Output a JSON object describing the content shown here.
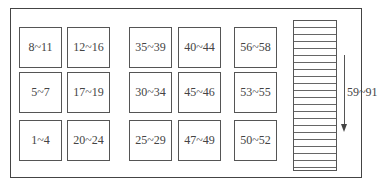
{
  "diagram": {
    "type": "storage-layout",
    "groups": [
      {
        "column": 1,
        "cells": [
          "8~11",
          "5~7",
          "1~4"
        ]
      },
      {
        "column": 2,
        "cells": [
          "12~16",
          "17~19",
          "20~24"
        ]
      },
      {
        "column": 3,
        "cells": [
          "35~39",
          "30~34",
          "25~29"
        ]
      },
      {
        "column": 4,
        "cells": [
          "40~44",
          "45~46",
          "47~49"
        ]
      },
      {
        "column": 5,
        "cells": [
          "56~58",
          "53~55",
          "50~52"
        ]
      }
    ],
    "stack": {
      "label": "59~91",
      "direction": "down",
      "stripe_count": 21
    }
  }
}
